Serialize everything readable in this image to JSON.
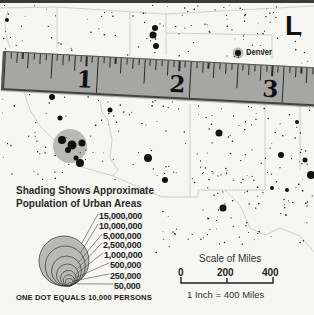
{
  "map": {
    "corner_letter": "L",
    "city_labels": [
      {
        "name": "Denver"
      }
    ]
  },
  "ruler": {
    "unit": "inch",
    "subdivisions_per_unit": 16,
    "labels": [
      "1",
      "2",
      "3"
    ]
  },
  "legend": {
    "title_line1": "Shading Shows Approximate",
    "title_line2": "Population of Urban Areas",
    "population_levels": [
      "15,000,000",
      "10,000,000",
      "5,000,000",
      "2,500,000",
      "1,000,000",
      "500,000",
      "250,000",
      "50,000"
    ],
    "dot_note": "ONE DOT EQUALS 10,000 PERSONS"
  },
  "scale": {
    "title": "Scale of Miles",
    "ticks": [
      "0",
      "200",
      "400"
    ],
    "note": "1 Inch = 400 Miles"
  },
  "colors": {
    "background": "#f6f6f3",
    "border": "#c6c6c2",
    "dots": "#111111",
    "urban_shading": "#b9b9b6",
    "ruler": "#a6a6a4"
  }
}
